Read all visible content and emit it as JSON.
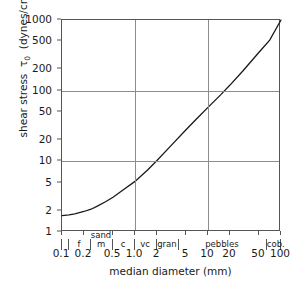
{
  "chart_data": {
    "type": "line",
    "title": "",
    "xlabel": "median diameter (mm)",
    "ylabel": "shear stress  τ₀  (dynes/cm²)",
    "ylabel_parts": {
      "prefix": "shear stress",
      "symbol": "τ",
      "subscript": "0",
      "units_open": "(dynes/cm",
      "exponent": "2",
      "units_close": ")"
    },
    "xscale": "log",
    "yscale": "log",
    "xlim": [
      0.1,
      100
    ],
    "ylim": [
      1,
      1000
    ],
    "grid": true,
    "gridlines_x": [
      1.0,
      10
    ],
    "gridlines_y": [
      10,
      100
    ],
    "legend": "none",
    "xticks": [
      0.1,
      0.2,
      0.5,
      1.0,
      2,
      5,
      10,
      20,
      50,
      100
    ],
    "xticklabels": [
      "0.1",
      "0.2",
      "0.5",
      "1.0",
      "2",
      "5",
      "10",
      "20",
      "50",
      "100"
    ],
    "yticks": [
      1,
      2,
      5,
      10,
      20,
      50,
      100,
      200,
      500,
      1000
    ],
    "yticklabels": [
      "1",
      "2",
      "5",
      "10",
      "20",
      "50",
      "100",
      "200",
      "500",
      "1000"
    ],
    "series": [
      {
        "name": "critical shear stress",
        "x": [
          0.1,
          0.125,
          0.15,
          0.2,
          0.25,
          0.3,
          0.4,
          0.5,
          0.7,
          1.0,
          1.5,
          2.0,
          3.0,
          5.0,
          7.0,
          10,
          15,
          20,
          30,
          50,
          70,
          100
        ],
        "y": [
          1.7,
          1.75,
          1.8,
          1.95,
          2.1,
          2.3,
          2.7,
          3.1,
          4.0,
          5.2,
          7.6,
          10.3,
          16.0,
          28.0,
          40.0,
          58.0,
          88.0,
          120.0,
          190.0,
          350.0,
          520.0,
          1000.0
        ]
      }
    ],
    "classification": {
      "groups": [
        {
          "label": "sand",
          "from": 0.1,
          "to": 2.0
        },
        {
          "label": "gran",
          "from": 2.0,
          "to": 4.0
        },
        {
          "label": "pebbles",
          "from": 4.0,
          "to": 64.0
        },
        {
          "label": "cob.",
          "from": 64.0,
          "to": 100.0
        }
      ],
      "subdivisions": [
        {
          "label": "f",
          "from": 0.125,
          "to": 0.25
        },
        {
          "label": "m",
          "from": 0.25,
          "to": 0.5
        },
        {
          "label": "c",
          "from": 0.5,
          "to": 1.0
        },
        {
          "label": "vc",
          "from": 1.0,
          "to": 2.0
        }
      ],
      "dividers": [
        0.1,
        0.125,
        0.25,
        0.5,
        1.0,
        2.0,
        4.0,
        64.0,
        100.0
      ]
    }
  }
}
